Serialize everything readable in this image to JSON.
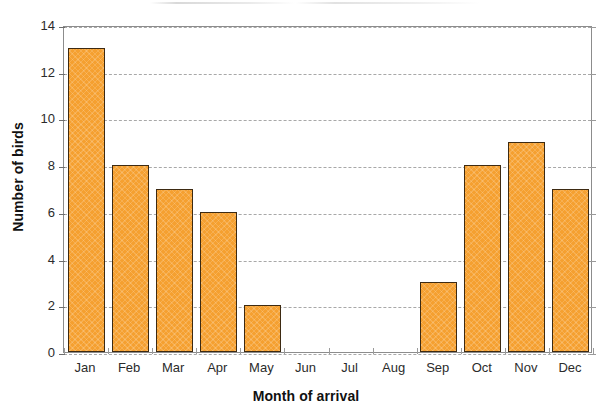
{
  "chart_data": {
    "type": "bar",
    "title": "",
    "subtitle": "",
    "xlabel": "Month of arrival",
    "ylabel": "Number of birds",
    "categories": [
      "Jan",
      "Feb",
      "Mar",
      "Apr",
      "May",
      "Jun",
      "Jul",
      "Aug",
      "Sep",
      "Oct",
      "Nov",
      "Dec"
    ],
    "values": [
      13,
      8,
      7,
      6,
      2,
      0,
      0,
      0,
      3,
      8,
      9,
      7
    ],
    "ylim": [
      0,
      14
    ],
    "yticks": [
      0,
      2,
      4,
      6,
      8,
      10,
      12,
      14
    ],
    "ytick_labels": [
      "0",
      "2",
      "4",
      "6",
      "8",
      "10",
      "12",
      "14"
    ],
    "grid": true,
    "grid_axis": "y",
    "grid_style": "dashed",
    "legend": false,
    "legend_position": "none",
    "series": [
      {
        "name": "Number of birds",
        "values": [
          13,
          8,
          7,
          6,
          2,
          0,
          0,
          0,
          3,
          8,
          9,
          7
        ]
      }
    ],
    "colors": {
      "bar_fill": "#f5a030",
      "bar_edge": "#3d2a12",
      "grid": "#9a9a9a",
      "axis": "#6e6e6e",
      "text": "#2b2b2b",
      "background": "#ffffff"
    }
  }
}
